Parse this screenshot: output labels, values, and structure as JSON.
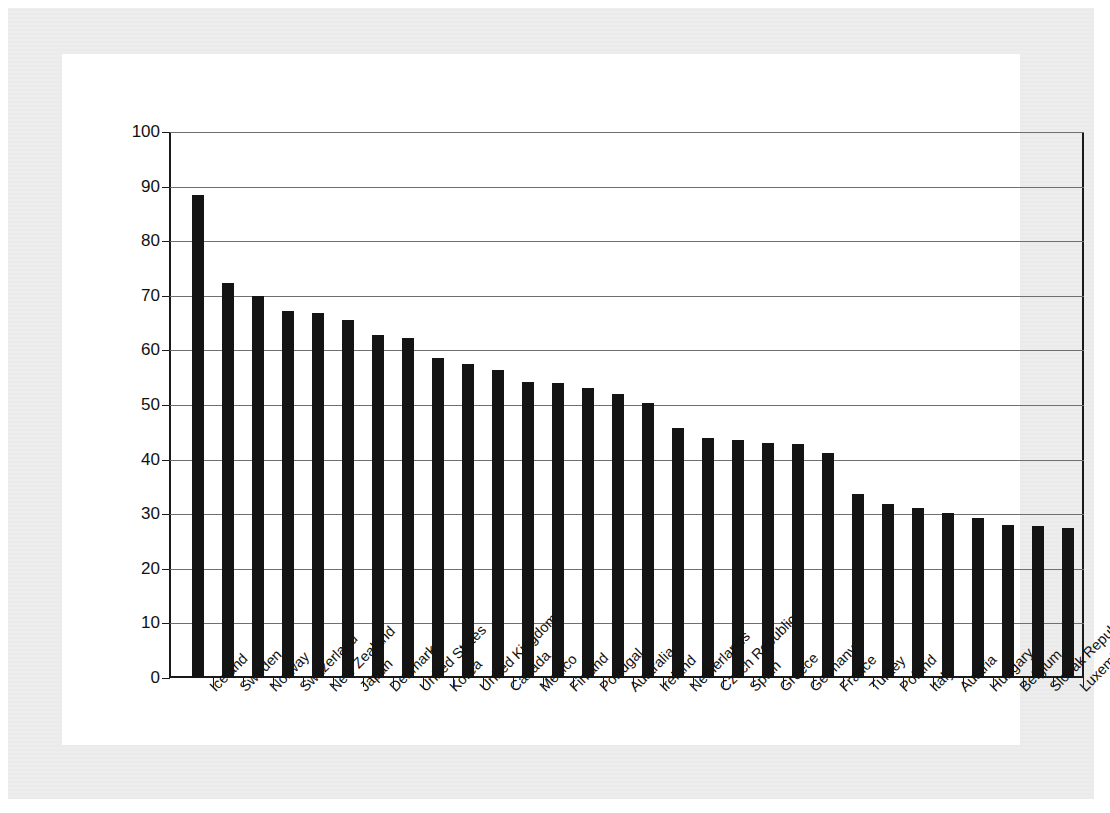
{
  "ghost_artifacts": {
    "top": "",
    "bottom": ""
  },
  "chart_data": {
    "type": "bar",
    "title": "",
    "xlabel": "",
    "ylabel": "",
    "ylim": [
      0,
      100
    ],
    "yticks": [
      0,
      10,
      20,
      30,
      40,
      50,
      60,
      70,
      80,
      90,
      100
    ],
    "grid": true,
    "legend": false,
    "bar_color": "#141414",
    "categories": [
      "Iceland",
      "Sweden",
      "Norway",
      "Switzerland",
      "New Zealand",
      "Japan",
      "Denmark",
      "United States",
      "Korea",
      "United Kingdom",
      "Canada",
      "Mexico",
      "Finland",
      "Portugal",
      "Australia",
      "Ireland",
      "Netherlands",
      "Czech Republic",
      "Spain",
      "Greece",
      "Germany",
      "France",
      "Turkey",
      "Poland",
      "Italy",
      "Austria",
      "Hungary",
      "Belgium",
      "Slovak Republic",
      "Luxembourg"
    ],
    "values": [
      88.5,
      72.3,
      69.9,
      67.3,
      66.8,
      65.6,
      62.9,
      62.2,
      58.6,
      57.5,
      56.5,
      54.3,
      54.0,
      53.2,
      52.0,
      50.3,
      45.7,
      44.0,
      43.6,
      43.0,
      42.8,
      41.3,
      33.7,
      31.8,
      31.1,
      30.3,
      29.3,
      28.0,
      27.9,
      27.4
    ]
  }
}
